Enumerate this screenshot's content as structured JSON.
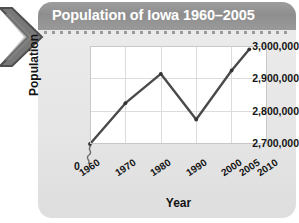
{
  "banner": {
    "title": "Population of Iowa 1960–2005",
    "title_bar_color": "#939393",
    "title_text_color": "#ffffff",
    "card_color": "#e9e9e9",
    "chevron_color": "#6e6e6e",
    "chevron_icon": "left-chevron-ribbon-icon"
  },
  "chart_data": {
    "type": "line",
    "title": "Population of Iowa 1960–2005",
    "xlabel": "Year",
    "ylabel": "Population",
    "x": [
      1960,
      1970,
      1980,
      1990,
      2000,
      2005
    ],
    "values": [
      2700000,
      2825000,
      2915000,
      2775000,
      2925000,
      2990000
    ],
    "series": [
      {
        "name": "Population of Iowa",
        "values": [
          2700000,
          2825000,
          2915000,
          2775000,
          2925000,
          2990000
        ]
      }
    ],
    "xtick_labels": [
      "1960",
      "1970",
      "1980",
      "1990",
      "2000",
      "2005",
      "2010"
    ],
    "xtick_values": [
      1960,
      1970,
      1980,
      1990,
      2000,
      2005,
      2010
    ],
    "ytick_labels": [
      "3,000,000",
      "2,900,000",
      "2,800,000",
      "2,700,000"
    ],
    "ytick_values": [
      3000000,
      2900000,
      2800000,
      2700000
    ],
    "y_origin_label": "0",
    "y_axis_break": true,
    "xlim": [
      1960,
      2010
    ],
    "ylim": [
      2700000,
      3000000
    ],
    "grid": true,
    "legend": "none",
    "line_color": "#4a4a4a",
    "marker": "dot",
    "marker_color": "#333333"
  }
}
